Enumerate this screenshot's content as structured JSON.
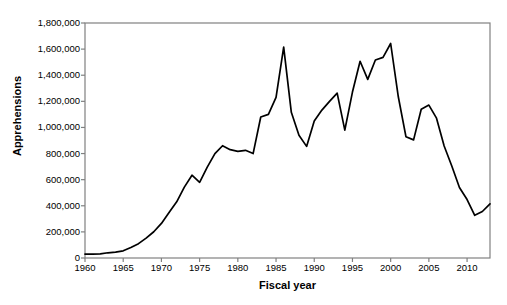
{
  "chart_data": {
    "type": "line",
    "title": "",
    "xlabel": "Fiscal year",
    "ylabel": "Apprehensions",
    "xlim": [
      1960,
      2013
    ],
    "ylim": [
      0,
      1800000
    ],
    "grid": false,
    "legend": "none",
    "line_color": "#000000",
    "background_color": "#ffffff",
    "axis_color": "#808080",
    "ytick_labels": [
      "1,800,000",
      "1,600,000",
      "1,400,000",
      "1,200,000",
      "1,000,000",
      "800,000",
      "600,000",
      "400,000",
      "200,000",
      "0"
    ],
    "ytick_values": [
      1800000,
      1600000,
      1400000,
      1200000,
      1000000,
      800000,
      600000,
      400000,
      200000,
      0
    ],
    "xtick_labels": [
      "1960",
      "1965",
      "1970",
      "1975",
      "1980",
      "1985",
      "1990",
      "1995",
      "2000",
      "2005",
      "2010"
    ],
    "xtick_values": [
      1960,
      1965,
      1970,
      1975,
      1980,
      1985,
      1990,
      1995,
      2000,
      2005,
      2010
    ],
    "x": [
      1960,
      1961,
      1962,
      1963,
      1964,
      1965,
      1966,
      1967,
      1968,
      1969,
      1970,
      1971,
      1972,
      1973,
      1974,
      1975,
      1976,
      1977,
      1978,
      1979,
      1980,
      1981,
      1982,
      1983,
      1984,
      1985,
      1986,
      1987,
      1988,
      1989,
      1990,
      1991,
      1992,
      1993,
      1994,
      1995,
      1996,
      1997,
      1998,
      1999,
      2000,
      2001,
      2002,
      2003,
      2004,
      2005,
      2006,
      2007,
      2008,
      2009,
      2010,
      2011,
      2012,
      2013
    ],
    "values": [
      30000,
      30000,
      31000,
      40000,
      45000,
      55000,
      80000,
      110000,
      152000,
      201000,
      265000,
      348000,
      430000,
      543000,
      634000,
      580000,
      696000,
      800000,
      860000,
      830000,
      817000,
      825000,
      800000,
      1080000,
      1100000,
      1230000,
      1615000,
      1116000,
      940000,
      855000,
      1049000,
      1133000,
      1200000,
      1263000,
      979000,
      1271000,
      1507000,
      1368000,
      1517000,
      1537000,
      1643000,
      1235000,
      929000,
      905000,
      1139000,
      1171000,
      1071000,
      858000,
      705000,
      540000,
      448000,
      327000,
      356000,
      414000
    ]
  }
}
